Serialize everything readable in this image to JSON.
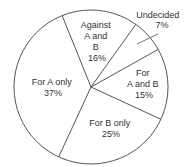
{
  "chart_data": {
    "type": "pie",
    "title": "",
    "slices": [
      {
        "label": "Against A and B",
        "value": 16,
        "display": [
          "Against",
          "A and",
          "B",
          "16%"
        ]
      },
      {
        "label": "Undecided",
        "value": 7,
        "display": [
          "Undecided",
          "7%"
        ]
      },
      {
        "label": "For A and B",
        "value": 15,
        "display": [
          "For",
          "A and B",
          "15%"
        ]
      },
      {
        "label": "For B only",
        "value": 25,
        "display": [
          "For B only",
          "25%"
        ]
      },
      {
        "label": "For A only",
        "value": 37,
        "display": [
          "For A only",
          "37%"
        ]
      }
    ],
    "categories": [
      "Against A and B",
      "Undecided",
      "For A and B",
      "For B only",
      "For A only"
    ],
    "values": [
      16,
      7,
      15,
      25,
      37
    ],
    "unit": "%",
    "legend": "none",
    "colors": {
      "fill": "#ffffff",
      "stroke": "#555555",
      "text": "#333333"
    }
  }
}
